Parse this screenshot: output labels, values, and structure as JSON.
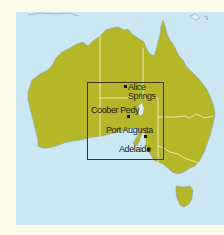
{
  "map": {
    "title": "Australia locator map",
    "colors": {
      "background": "#fdfbea",
      "sea": "#cbe7f3",
      "land": "#b6b629",
      "state_border": "#f3efb8",
      "coast": "#8aa6b4",
      "inset_box": "#3a3420",
      "text": "#1a1a10"
    },
    "inset_box": {
      "x": 87,
      "y": 82,
      "width": 77,
      "height": 78
    },
    "places": [
      {
        "name": "Alice",
        "name_line2": "Springs",
        "dot": [
          125,
          86
        ],
        "label_pos": [
          128,
          83
        ]
      },
      {
        "name": "Coober Pedy",
        "dot": [
          128,
          116
        ],
        "label_pos": [
          91,
          106
        ]
      },
      {
        "name": "Port Augusta",
        "dot": [
          145,
          136
        ],
        "label_pos": [
          106,
          126
        ]
      },
      {
        "name": "Adelaide",
        "dot": [
          148,
          149
        ],
        "label_pos": [
          119,
          145
        ]
      }
    ]
  }
}
